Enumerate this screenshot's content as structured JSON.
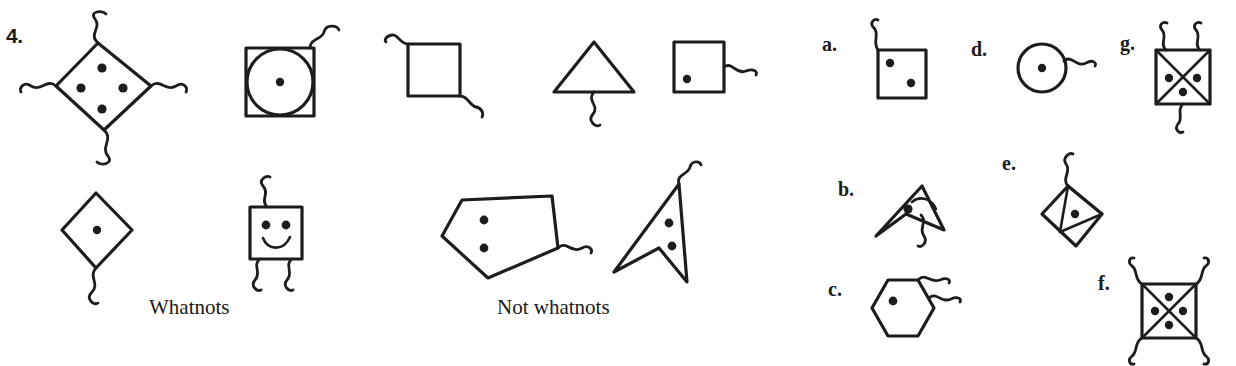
{
  "question": {
    "number_label": "4.",
    "positive_caption": "Whatnots",
    "negative_caption": "Not whatnots"
  },
  "ink_color": "#1d1d1b",
  "background_color": "#ffffff",
  "examples": {
    "whatnots": [
      {
        "id": "w1",
        "shape": "diamond",
        "dots": 4,
        "tails": 4,
        "note": "diamond with four dots and a squiggly tail at each vertex"
      },
      {
        "id": "w2",
        "shape": "square-with-inscribed-circle",
        "dots": 1,
        "tails": 1,
        "note": "square containing a circle, one central dot, tail from top-right"
      },
      {
        "id": "w3",
        "shape": "diamond",
        "dots": 1,
        "tails": 1,
        "note": "diamond with one central dot and a tail at the bottom vertex"
      },
      {
        "id": "w4",
        "shape": "square-smiley",
        "dots": 2,
        "tails": 3,
        "note": "square with two eye dots and a smile, three tails"
      }
    ],
    "not_whatnots": [
      {
        "id": "n1",
        "shape": "square",
        "dots": 0,
        "tails": 2,
        "note": "plain square with two tails, no dots"
      },
      {
        "id": "n2",
        "shape": "triangle",
        "dots": 0,
        "tails": 1,
        "note": "triangle with one tail, no dots"
      },
      {
        "id": "n3",
        "shape": "square",
        "dots": 1,
        "tails": 1,
        "note": "square with one dot and one tail"
      },
      {
        "id": "n4",
        "shape": "pentagon",
        "dots": 2,
        "tails": 1,
        "note": "pentagon with two dots and one tail"
      },
      {
        "id": "n5",
        "shape": "concave-dart",
        "dots": 2,
        "tails": 1,
        "note": "arrow/dart shape with two dots and one tail"
      }
    ]
  },
  "options": [
    {
      "key": "a.",
      "shape": "square",
      "dots": 2,
      "tails": 1,
      "note": "square with two dots and a tail from the top-left corner"
    },
    {
      "key": "b.",
      "shape": "concave-dart",
      "dots": 1,
      "tails": 1,
      "note": "dart shape with one dot, an arc, and a tail"
    },
    {
      "key": "c.",
      "shape": "hexagon",
      "dots": 1,
      "tails": 2,
      "note": "hexagon with one dot and two tails"
    },
    {
      "key": "d.",
      "shape": "circle",
      "dots": 1,
      "tails": 1,
      "note": "circle with one central dot and a tail at the right"
    },
    {
      "key": "e.",
      "shape": "diamond-with-internal-lines",
      "dots": 1,
      "tails": 1,
      "note": "diamond crossed by internal lines, one dot, tail at top"
    },
    {
      "key": "f.",
      "shape": "square-with-x",
      "dots": 4,
      "tails": 4,
      "note": "square with an X inside, four dots, four corner tails"
    },
    {
      "key": "g.",
      "shape": "square-with-x",
      "dots": 3,
      "tails": 3,
      "note": "square with an X inside, three dots, three tails"
    }
  ]
}
